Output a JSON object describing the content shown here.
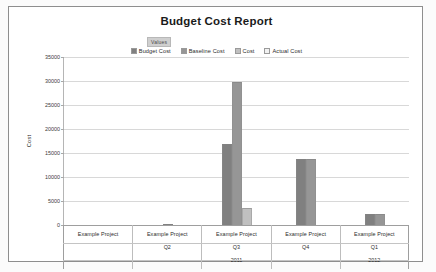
{
  "report": {
    "title": "Budget Cost Report"
  },
  "legend": {
    "group_label": "Values",
    "items": [
      {
        "label": "Budget Cost",
        "color": "#808080",
        "icon": "legend-swatch-icon"
      },
      {
        "label": "Baseline Cost",
        "color": "#969696",
        "icon": "legend-swatch-icon"
      },
      {
        "label": "Cost",
        "color": "#c0c0c0",
        "icon": "legend-swatch-icon"
      },
      {
        "label": "Actual Cost",
        "color": "#f2f2f2",
        "icon": "legend-swatch-icon"
      }
    ]
  },
  "axes": {
    "y_title": "Cost",
    "y_ticks": [
      "35000",
      "30000",
      "25000",
      "20000",
      "15000",
      "10000",
      "5000",
      "0"
    ]
  },
  "categories_table": [
    {
      "project": "Example Project",
      "quarter": "",
      "year": ""
    },
    {
      "project": "Example Project",
      "quarter": "Q2",
      "year": ""
    },
    {
      "project": "Example Project",
      "quarter": "Q3",
      "year": "2011"
    },
    {
      "project": "Example Project",
      "quarter": "Q4",
      "year": ""
    },
    {
      "project": "Example Project",
      "quarter": "Q1",
      "year": "2012"
    }
  ],
  "chart_data": {
    "type": "bar",
    "title": "Budget Cost Report",
    "xlabel": "",
    "ylabel": "Cost",
    "ylim": [
      0,
      35000
    ],
    "ytick_step": 5000,
    "grid": true,
    "legend_position": "top-center",
    "categories": [
      "Example Project",
      "Example Project Q2",
      "Example Project Q3 2011",
      "Example Project Q4",
      "Example Project Q1 2012"
    ],
    "series": [
      {
        "name": "Budget Cost",
        "color": "#808080",
        "values": [
          0,
          300,
          16800,
          13800,
          2400
        ]
      },
      {
        "name": "Baseline Cost",
        "color": "#969696",
        "values": [
          0,
          0,
          29800,
          13800,
          2400
        ]
      },
      {
        "name": "Cost",
        "color": "#c0c0c0",
        "values": [
          0,
          0,
          3500,
          0,
          0
        ]
      },
      {
        "name": "Actual Cost",
        "color": "#f2f2f2",
        "values": [
          0,
          0,
          0,
          0,
          0
        ]
      }
    ]
  }
}
